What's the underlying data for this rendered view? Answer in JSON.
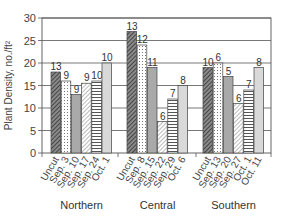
{
  "chart_data": {
    "type": "bar",
    "title": "",
    "xlabel": "",
    "ylabel": "Plant Density, no./ft²",
    "ylim": [
      0,
      30
    ],
    "yticks": [
      0,
      5,
      10,
      15,
      20,
      25,
      30
    ],
    "grid": true,
    "legend": "none",
    "groups": [
      {
        "name": "Northern",
        "categories": [
          "Uncut",
          "Sep. 3",
          "Sep. 10",
          "Sep. 17",
          "Sep. 24",
          "Oct. 1"
        ],
        "values": [
          18,
          16,
          13,
          15.5,
          16,
          20
        ],
        "labels": [
          "13",
          "9",
          "9",
          "9",
          "10",
          "10"
        ]
      },
      {
        "name": "Central",
        "categories": [
          "Uncut",
          "Sep. 8",
          "Sep. 15",
          "Sep. 22",
          "Sep. 29",
          "Oct. 6"
        ],
        "values": [
          27,
          24,
          19,
          7,
          12,
          15
        ],
        "labels": [
          "13",
          "12",
          "11",
          "6",
          "7",
          "8"
        ]
      },
      {
        "name": "Southern",
        "categories": [
          "Uncut",
          "Sep. 13",
          "Sep. 20",
          "Sep. 27",
          "Oct. 1",
          "Oct. 11"
        ],
        "values": [
          19,
          20,
          17,
          11,
          14,
          19
        ],
        "labels": [
          "10",
          "6",
          "5",
          "6",
          "7",
          "8"
        ]
      }
    ],
    "patterns": [
      "dense-diagonal",
      "dotted",
      "solid-gray",
      "light-diagonal",
      "horizontal-lines",
      "light-gray"
    ]
  }
}
